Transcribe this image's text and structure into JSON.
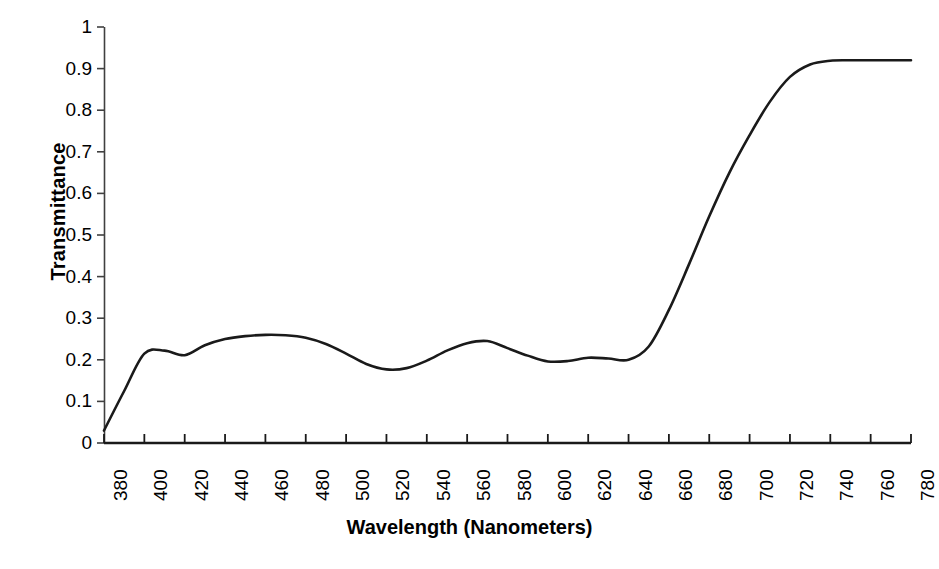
{
  "chart_data": {
    "type": "line",
    "title": "",
    "xlabel": "Wavelength  (Nanometers)",
    "ylabel": "Transmittance",
    "xlim": [
      380,
      780
    ],
    "ylim": [
      0,
      1
    ],
    "grid": false,
    "legend": null,
    "line_color": "#1a1a1a",
    "x_tick_labels": [
      "380",
      "400",
      "420",
      "440",
      "460",
      "480",
      "500",
      "520",
      "540",
      "560",
      "580",
      "600",
      "620",
      "640",
      "660",
      "680",
      "700",
      "720",
      "740",
      "760",
      "780"
    ],
    "y_tick_labels": [
      "0",
      "0.1",
      "0.2",
      "0.3",
      "0.4",
      "0.5",
      "0.6",
      "0.7",
      "0.8",
      "0.9",
      "1"
    ],
    "x": [
      380,
      390,
      400,
      410,
      420,
      430,
      440,
      450,
      460,
      470,
      480,
      490,
      500,
      510,
      520,
      530,
      540,
      550,
      560,
      570,
      580,
      590,
      600,
      610,
      620,
      630,
      640,
      650,
      660,
      670,
      680,
      690,
      700,
      710,
      720,
      730,
      740,
      750,
      760,
      770,
      780
    ],
    "y": [
      0.03,
      0.125,
      0.215,
      0.222,
      0.211,
      0.235,
      0.25,
      0.257,
      0.26,
      0.259,
      0.253,
      0.238,
      0.215,
      0.19,
      0.177,
      0.18,
      0.198,
      0.222,
      0.24,
      0.245,
      0.228,
      0.21,
      0.196,
      0.197,
      0.205,
      0.203,
      0.2,
      0.232,
      0.32,
      0.43,
      0.545,
      0.65,
      0.74,
      0.82,
      0.88,
      0.91,
      0.919,
      0.92,
      0.92,
      0.92,
      0.92
    ],
    "series": [
      {
        "name": "Transmittance",
        "values": [
          0.03,
          0.125,
          0.215,
          0.222,
          0.211,
          0.235,
          0.25,
          0.257,
          0.26,
          0.259,
          0.253,
          0.238,
          0.215,
          0.19,
          0.177,
          0.18,
          0.198,
          0.222,
          0.24,
          0.245,
          0.228,
          0.21,
          0.196,
          0.197,
          0.205,
          0.203,
          0.2,
          0.232,
          0.32,
          0.43,
          0.545,
          0.65,
          0.74,
          0.82,
          0.88,
          0.91,
          0.919,
          0.92,
          0.92,
          0.92,
          0.92
        ]
      }
    ]
  },
  "axes": {
    "x_title": "Wavelength  (Nanometers)",
    "y_title": "Transmittance"
  },
  "caption": {
    "text": ""
  }
}
